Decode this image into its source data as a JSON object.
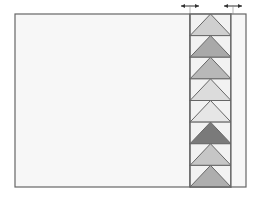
{
  "diagram": {
    "colors": {
      "background": "#ffffff",
      "panel_fill": "#f7f7f7",
      "outline": "#666666",
      "block_bg": "#f2f2f2"
    },
    "outer_box": {
      "x": 15,
      "y": 14,
      "w": 231,
      "h": 173
    },
    "border_strip": {
      "x": 190,
      "w": 41
    },
    "outer_strip": {
      "x": 231,
      "w": 15
    },
    "markers": [
      {
        "name": "strip-width-arrow",
        "x1": 181,
        "x2": 199,
        "y": 6
      },
      {
        "name": "outer-border-width-arrow",
        "x1": 224,
        "x2": 242,
        "y": 6
      }
    ],
    "geese": [
      {
        "fill": "#cfcfcf"
      },
      {
        "fill": "#a9a9a9"
      },
      {
        "fill": "#b8b8b8"
      },
      {
        "fill": "#dcdcdc"
      },
      {
        "fill": "#e6e6e6"
      },
      {
        "fill": "#7a7a7a"
      },
      {
        "fill": "#c6c6c6"
      },
      {
        "fill": "#aeaeae"
      }
    ]
  }
}
